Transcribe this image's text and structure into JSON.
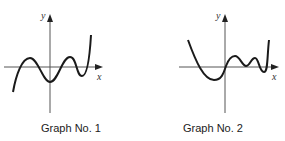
{
  "graphs": [
    {
      "caption": "Graph No. 1",
      "x_label": "x",
      "y_label": "y"
    },
    {
      "caption": "Graph No. 2",
      "x_label": "x",
      "y_label": "y"
    }
  ],
  "colors": {
    "curve": "#1a1a1a",
    "axis": "#555555"
  }
}
